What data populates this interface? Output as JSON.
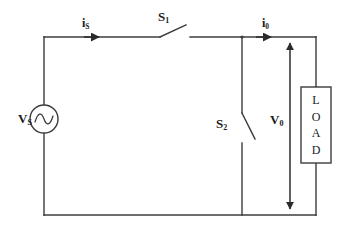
{
  "diagram": {
    "stroke_color": "#3c3c3c",
    "text_color": "#1a1a1a",
    "background_color": "#ffffff"
  },
  "labels": {
    "source": {
      "symbol": "V",
      "subscript": "S"
    },
    "source_current": {
      "symbol": "i",
      "subscript": "S"
    },
    "output_current": {
      "symbol": "i",
      "subscript": "0"
    },
    "switch_1": {
      "symbol": "S",
      "subscript": "1"
    },
    "switch_2": {
      "symbol": "S",
      "subscript": "2"
    },
    "output_voltage": {
      "symbol": "V",
      "subscript": "0"
    }
  },
  "load": {
    "letters": [
      "L",
      "O",
      "A",
      "D"
    ],
    "text": "LOAD"
  }
}
